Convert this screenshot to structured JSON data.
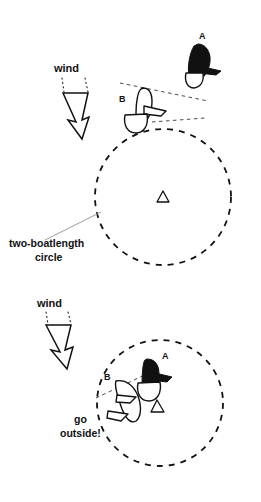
{
  "figure": {
    "background_color": "#ffffff",
    "ink_color": "#111111",
    "leader_color": "#9b9b9b"
  },
  "panels": [
    {
      "id": "top-panel",
      "name": "approach-panel",
      "wind_label": "wind",
      "circle_label_line1": "two-boatlength",
      "circle_label_line2": "circle",
      "boats": [
        {
          "id": "A",
          "label": "A",
          "fill": "dark"
        },
        {
          "id": "B",
          "label": "B",
          "fill": "light"
        }
      ],
      "mark_label": "",
      "circle": {
        "cx": 163,
        "cy": 197,
        "r": 68
      }
    },
    {
      "id": "bottom-panel",
      "name": "inside-panel",
      "wind_label": "wind",
      "instruction_line1": "go",
      "instruction_line2": "outside!",
      "boats": [
        {
          "id": "A",
          "label": "A",
          "fill": "dark"
        },
        {
          "id": "B",
          "label": "B",
          "fill": "light"
        }
      ],
      "circle": {
        "cx": 160,
        "cy": 403,
        "r": 63
      }
    }
  ],
  "icons": {
    "wind_arrow": "wind-arrow-icon",
    "mark_buoy": "mark-triangle-icon",
    "boat_dark": "sailboat-dark-icon",
    "boat_light": "sailboat-light-icon"
  }
}
